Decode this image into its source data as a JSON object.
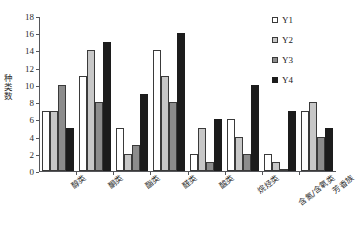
{
  "chart_data": {
    "type": "bar",
    "title": "",
    "xlabel": "",
    "ylabel": "种类数",
    "ylim": [
      0,
      18
    ],
    "yticks": [
      0,
      2,
      4,
      6,
      8,
      10,
      12,
      14,
      16,
      18
    ],
    "grid": false,
    "legend_position": "right",
    "categories": [
      "醇类",
      "酮类",
      "酯类",
      "醛类",
      "酸类",
      "烷烃类",
      "含氮/含氧类",
      "芳香族"
    ],
    "series": [
      {
        "name": "Y1",
        "color": "#ffffff",
        "values": [
          7,
          11,
          5,
          14,
          2,
          6,
          2,
          7
        ]
      },
      {
        "name": "Y2",
        "color": "#c7c7c7",
        "values": [
          7,
          14,
          2,
          11,
          5,
          4,
          1,
          8
        ]
      },
      {
        "name": "Y3",
        "color": "#8c8c8c",
        "values": [
          10,
          8,
          3,
          8,
          1,
          2,
          0,
          4
        ]
      },
      {
        "name": "Y4",
        "color": "#1c1c1c",
        "values": [
          5,
          15,
          9,
          16,
          6,
          10,
          7,
          5
        ]
      }
    ]
  }
}
